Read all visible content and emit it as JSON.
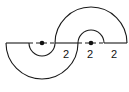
{
  "diagram": {
    "stroke_color": "#1a1a1a",
    "background": "#ffffff",
    "shapes": [
      {
        "name": "lower-annulus",
        "center": [
          42,
          43
        ],
        "outer_radius": 36,
        "inner_radius": 13,
        "orientation": "down"
      },
      {
        "name": "upper-annulus",
        "center": [
          91,
          43
        ],
        "outer_radius": 36,
        "inner_radius": 13,
        "orientation": "up"
      }
    ],
    "centers": [
      {
        "name": "center-left",
        "x": 42,
        "y": 43
      },
      {
        "name": "center-right",
        "x": 91,
        "y": 43
      }
    ],
    "labels": [
      {
        "text": "2",
        "x": 66,
        "y": 58
      },
      {
        "text": "2",
        "x": 90,
        "y": 58
      },
      {
        "text": "2",
        "x": 114,
        "y": 58
      }
    ]
  }
}
